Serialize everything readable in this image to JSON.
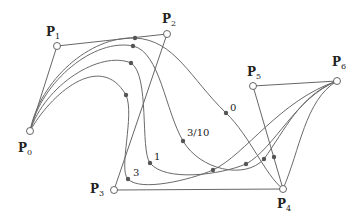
{
  "diagram": {
    "type": "spline-curves-with-control-polygon",
    "colors": {
      "background": "#ffffff",
      "curve": "#6a6a6a",
      "polygon": "#555555",
      "point_marker": "#555555",
      "label": "#222222"
    },
    "control_points": [
      {
        "id": "P0",
        "label": "P",
        "sub": "0",
        "x": 30,
        "y": 131,
        "lx": 18,
        "ly": 152
      },
      {
        "id": "P1",
        "label": "P",
        "sub": "1",
        "x": 57,
        "y": 46,
        "lx": 46,
        "ly": 36
      },
      {
        "id": "P2",
        "label": "P",
        "sub": "2",
        "x": 167,
        "y": 34,
        "lx": 162,
        "ly": 23
      },
      {
        "id": "P3",
        "label": "P",
        "sub": "3",
        "x": 114,
        "y": 190,
        "lx": 90,
        "ly": 193
      },
      {
        "id": "P4",
        "label": "P",
        "sub": "4",
        "x": 283,
        "y": 189,
        "lx": 277,
        "ly": 208
      },
      {
        "id": "P5",
        "label": "P",
        "sub": "5",
        "x": 253,
        "y": 86,
        "lx": 247,
        "ly": 76
      },
      {
        "id": "P6",
        "label": "P",
        "sub": "6",
        "x": 337,
        "y": 81,
        "lx": 332,
        "ly": 66
      }
    ],
    "curves": [
      {
        "param_label": "0",
        "label_x": 230,
        "label_y": 111,
        "path": "M30,131 C40,80 90,36 135,38 C175,40 190,78 226,113 C250,136 265,175 283,189 C300,150 305,100 337,81",
        "markers": [
          [
            135,
            38
          ],
          [
            226,
            113
          ],
          [
            274,
            157
          ]
        ]
      },
      {
        "param_label": "3/10",
        "label_x": 187,
        "label_y": 136,
        "path": "M30,131 C42,80 95,38 133,46 C160,52 165,110 183,141 C200,170 245,180 264,159 C285,130 300,95 337,81",
        "markers": [
          [
            133,
            46
          ],
          [
            183,
            141
          ],
          [
            264,
            159
          ]
        ]
      },
      {
        "param_label": "1",
        "label_x": 154,
        "label_y": 160,
        "path": "M30,131 C45,85 100,50 131,63 C150,75 140,150 150,163 C165,182 220,175 246,164 C275,148 295,98 337,81",
        "markers": [
          [
            131,
            63
          ],
          [
            150,
            163
          ],
          [
            246,
            164
          ]
        ]
      },
      {
        "param_label": "3",
        "label_x": 133,
        "label_y": 176,
        "path": "M30,131 C50,95 100,50 126,95 C135,115 118,170 128,179 C140,192 190,180 213,170 C245,155 280,100 337,81",
        "markers": [
          [
            126,
            95
          ],
          [
            128,
            179
          ],
          [
            213,
            170
          ]
        ]
      }
    ]
  }
}
